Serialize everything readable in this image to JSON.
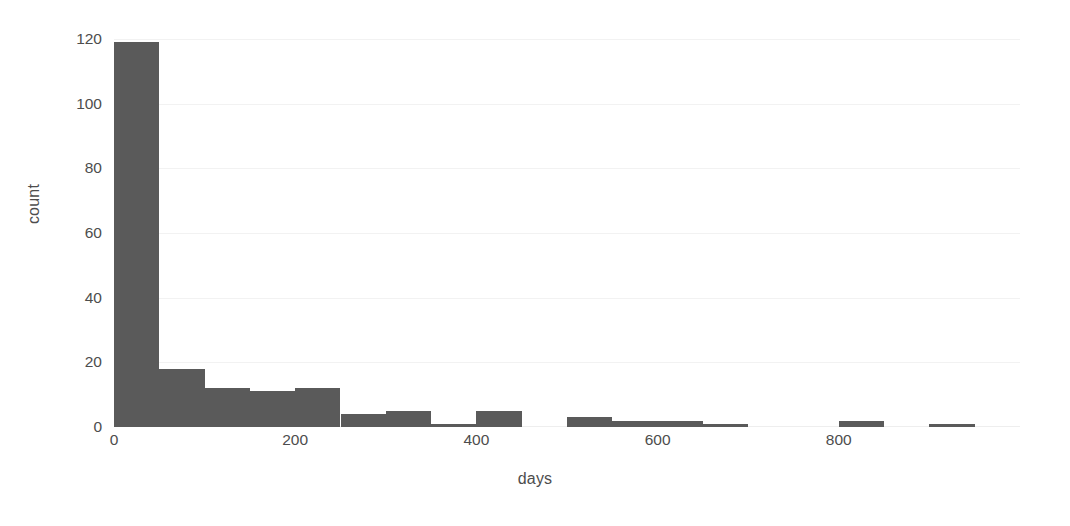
{
  "chart_data": {
    "type": "bar",
    "title": "",
    "subtitle": "",
    "xlabel": "days",
    "ylabel": "count",
    "grid": true,
    "legend": null,
    "xlim": [
      0,
      1000
    ],
    "ylim": [
      0,
      120
    ],
    "bin_width": 50,
    "xticks": [
      0,
      200,
      400,
      600,
      800
    ],
    "xtick_labels": [
      "0",
      "200",
      "400",
      "600",
      "800"
    ],
    "yticks": [
      0,
      20,
      40,
      60,
      80,
      100,
      120
    ],
    "ytick_labels": [
      "0",
      "20",
      "40",
      "60",
      "80",
      "100",
      "120"
    ],
    "bar_color": "#5a5a5a",
    "background_color": "#ffffff",
    "gridline_color": "#f2f2f2",
    "bin_edges": [
      0,
      50,
      100,
      150,
      200,
      250,
      300,
      350,
      400,
      450,
      500,
      550,
      600,
      650,
      700,
      750,
      800,
      850,
      900,
      950
    ],
    "categories": [
      "0-50",
      "50-100",
      "100-150",
      "150-200",
      "200-250",
      "250-300",
      "300-350",
      "350-400",
      "400-450",
      "450-500",
      "500-550",
      "550-600",
      "600-650",
      "650-700",
      "700-750",
      "750-800",
      "800-850",
      "850-900",
      "900-950"
    ],
    "values": [
      119,
      18,
      12,
      11,
      12,
      4,
      5,
      1,
      5,
      0,
      3,
      2,
      2,
      1,
      0,
      0,
      2,
      0,
      1
    ]
  }
}
